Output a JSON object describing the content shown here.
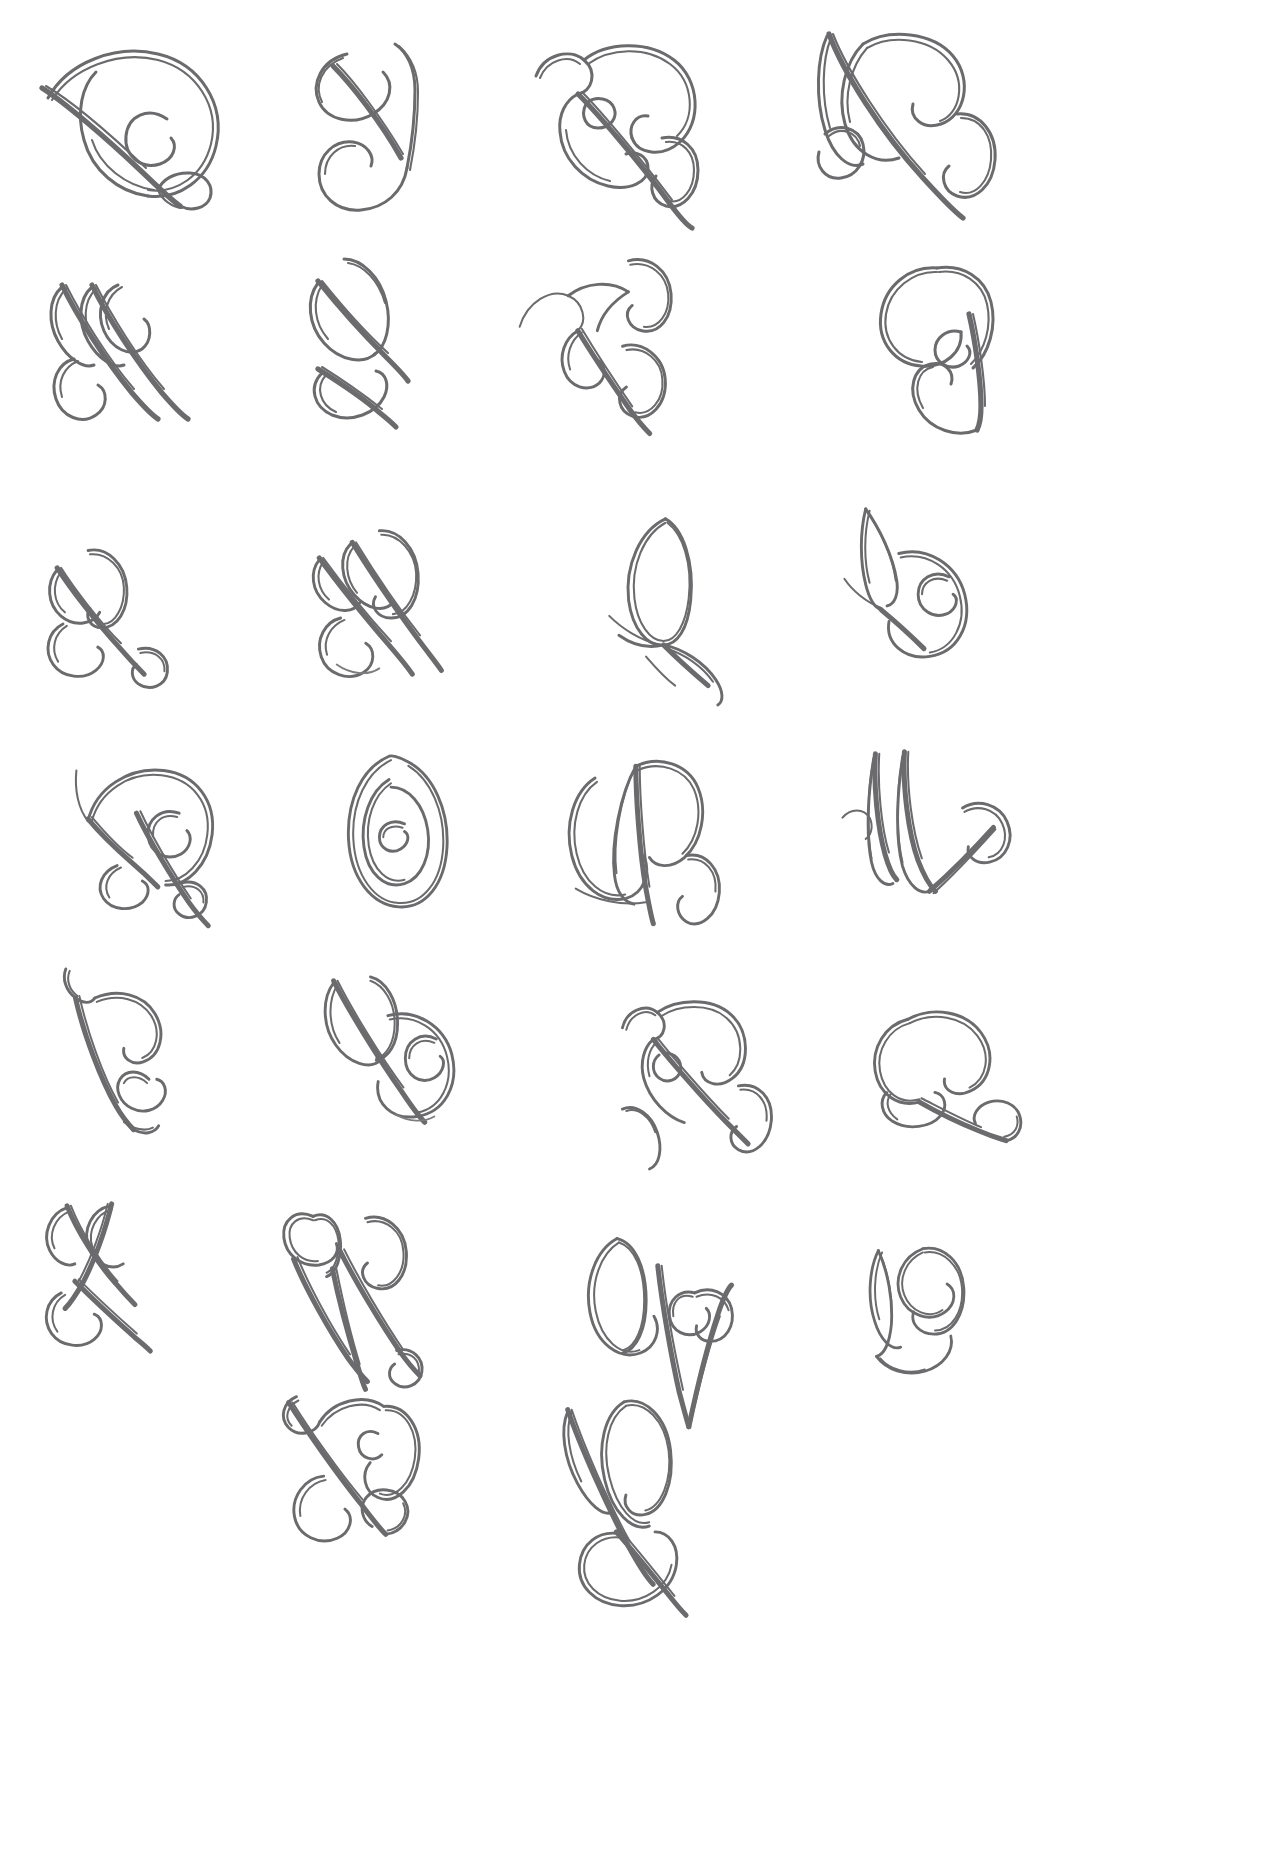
{
  "document": {
    "kind": "handwritten-calligraphy-practice-sheet",
    "title": "Flourished Capital Letters Practice Sheet",
    "medium": "grey fineliner pen on white paper",
    "background_color": "#ffffff",
    "ink_color": "#6b6b6e",
    "page_width": 1263,
    "page_height": 1874,
    "columns": 4,
    "rows": 7,
    "total_glyphs": 26
  },
  "grid": {
    "column_centers": [
      120,
      370,
      635,
      905
    ],
    "row_centers": [
      115,
      340,
      590,
      820,
      1045,
      1285,
      1520
    ]
  },
  "glyphs": [
    {
      "id": "g1",
      "row": 1,
      "col": 1,
      "letter": "Q",
      "description": "ornate capital Q with large bowl, inner spiral and descending loop tail",
      "x": 30,
      "y": 28,
      "w": 200,
      "h": 190
    },
    {
      "id": "g2",
      "row": 1,
      "col": 2,
      "letter": "J",
      "description": "capital J with upper oval loop and lower curl",
      "x": 295,
      "y": 40,
      "w": 150,
      "h": 180
    },
    {
      "id": "g3",
      "row": 1,
      "col": 3,
      "letter": "R",
      "description": "capital R with entry curl, tall bowl and swinging leg",
      "x": 530,
      "y": 30,
      "w": 190,
      "h": 195
    },
    {
      "id": "g4",
      "row": 1,
      "col": 4,
      "letter": "R",
      "description": "capital R with tall ascending loop and double bowls",
      "x": 805,
      "y": 18,
      "w": 205,
      "h": 210
    },
    {
      "id": "g5",
      "row": 2,
      "col": 1,
      "letter": "H",
      "description": "capital H made of two crossing loops with lower flourish",
      "x": 40,
      "y": 265,
      "w": 170,
      "h": 160
    },
    {
      "id": "g6",
      "row": 2,
      "col": 2,
      "letter": "K",
      "description": "capital K with tall oval loop and crossing lower loops",
      "x": 300,
      "y": 255,
      "w": 155,
      "h": 170
    },
    {
      "id": "g7",
      "row": 2,
      "col": 3,
      "letter": "Z",
      "description": "capital Z with top spiral, diagonal and bottom oval loop",
      "x": 515,
      "y": 255,
      "w": 185,
      "h": 165
    },
    {
      "id": "g8",
      "row": 2,
      "col": 4,
      "letter": "G",
      "description": "capital G with big upper oval and lower curled bowl",
      "x": 865,
      "y": 258,
      "w": 160,
      "h": 170
    },
    {
      "id": "g9",
      "row": 3,
      "col": 1,
      "letter": "L",
      "description": "capital L with upper curl and crossed looping base",
      "x": 35,
      "y": 535,
      "w": 170,
      "h": 145
    },
    {
      "id": "g10",
      "row": 3,
      "col": 2,
      "letter": "H",
      "description": "capital H with twin tall ovals and crossing lower loops",
      "x": 305,
      "y": 525,
      "w": 170,
      "h": 155
    },
    {
      "id": "g11",
      "row": 3,
      "col": 3,
      "letter": "P",
      "description": "capital P with pointed leaf bowl and crossing tail",
      "x": 605,
      "y": 515,
      "w": 150,
      "h": 160
    },
    {
      "id": "g12",
      "row": 3,
      "col": 4,
      "letter": "E",
      "description": "capital E with pointed entry stroke and inner spiral bowl",
      "x": 840,
      "y": 505,
      "w": 165,
      "h": 165
    },
    {
      "id": "g13",
      "row": 4,
      "col": 1,
      "letter": "D",
      "description": "capital D with rounded bowl, inner curl and looped descender",
      "x": 70,
      "y": 755,
      "w": 165,
      "h": 160
    },
    {
      "id": "g14",
      "row": 4,
      "col": 2,
      "letter": "O",
      "description": "capital O drawn as a concentric spiral oval",
      "x": 335,
      "y": 750,
      "w": 140,
      "h": 165
    },
    {
      "id": "g15",
      "row": 4,
      "col": 3,
      "letter": "U",
      "description": "capital U with pointed centre stem and looping tail",
      "x": 560,
      "y": 745,
      "w": 175,
      "h": 165
    },
    {
      "id": "g16",
      "row": 4,
      "col": 4,
      "letter": "M",
      "description": "capital M with three tall slanted strokes and end curl",
      "x": 840,
      "y": 748,
      "w": 185,
      "h": 150
    },
    {
      "id": "g17",
      "row": 5,
      "col": 1,
      "letter": "C",
      "description": "capital C with long pointed entry and double inner curls",
      "x": 60,
      "y": 965,
      "w": 150,
      "h": 155
    },
    {
      "id": "g18",
      "row": 5,
      "col": 2,
      "letter": "B",
      "description": "capital B with tall loop and large spiralled lower bowl",
      "x": 320,
      "y": 975,
      "w": 160,
      "h": 155
    },
    {
      "id": "g19",
      "row": 5,
      "col": 3,
      "letter": "R",
      "description": "capital R with entry curl, bowl, eyelet and swinging leg",
      "x": 620,
      "y": 995,
      "w": 175,
      "h": 145
    },
    {
      "id": "g20",
      "row": 5,
      "col": 4,
      "letter": "C",
      "description": "capital C with round bowl and crossed flourished base",
      "x": 865,
      "y": 1000,
      "w": 160,
      "h": 130
    },
    {
      "id": "g21",
      "row": 6,
      "col": 1,
      "letter": "F",
      "description": "capital F with crossing loops forming a bow-tie and lower oval",
      "x": 40,
      "y": 1200,
      "w": 150,
      "h": 150
    },
    {
      "id": "g22",
      "row": 6,
      "col": 2,
      "letter": "W",
      "description": "capital W with hooked entry, three descending strokes and oval",
      "x": 280,
      "y": 1195,
      "w": 170,
      "h": 170
    },
    {
      "id": "g23",
      "row": 6,
      "col": 3,
      "letter": "V",
      "description": "capital V with left oval loop, deep pointed vee and inner spiral",
      "x": 580,
      "y": 1225,
      "w": 175,
      "h": 160
    },
    {
      "id": "g24",
      "row": 6,
      "col": 4,
      "letter": "S",
      "description": "capital S with tall entry stroke and double curved bowls",
      "x": 865,
      "y": 1245,
      "w": 140,
      "h": 130
    },
    {
      "id": "g25",
      "row": 7,
      "col": 2,
      "letter": "X",
      "description": "capital X with upper spiral bowl and crossed looping base",
      "x": 275,
      "y": 1385,
      "w": 170,
      "h": 160
    },
    {
      "id": "g26",
      "row": 7,
      "col": 3,
      "letter": "Y",
      "description": "capital Y with tall loop, upper oval and long looping descender",
      "x": 560,
      "y": 1390,
      "w": 160,
      "h": 180
    }
  ]
}
